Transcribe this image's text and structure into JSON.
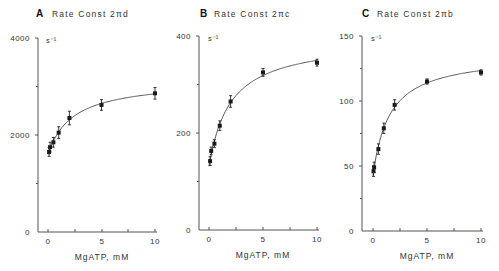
{
  "chart_data": [
    {
      "type": "scatter",
      "panel": "A",
      "title": "Rate Const 2πd",
      "xlabel": "MgATP, mM",
      "ylabel": "s⁻¹",
      "xlim": [
        0,
        10
      ],
      "ylim": [
        0,
        4000
      ],
      "xticks": [
        0,
        5,
        10
      ],
      "yticks": [
        0,
        2000,
        4000
      ],
      "fit_curve": true,
      "grid": false,
      "x": [
        0.1,
        0.2,
        0.5,
        1,
        2,
        5,
        10
      ],
      "y": [
        1650,
        1750,
        1850,
        2050,
        2350,
        2620,
        2860
      ],
      "yerr": [
        90,
        100,
        100,
        120,
        140,
        110,
        120
      ]
    },
    {
      "type": "scatter",
      "panel": "B",
      "title": "Rate Const 2πc",
      "xlabel": "MgATP, mM",
      "ylabel": "s⁻¹",
      "xlim": [
        0,
        10
      ],
      "ylim": [
        0,
        400
      ],
      "xticks": [
        0,
        5,
        10
      ],
      "yticks": [
        0,
        200,
        400
      ],
      "fit_curve": true,
      "grid": false,
      "x": [
        0.1,
        0.2,
        0.5,
        1,
        2,
        5,
        10
      ],
      "y": [
        142,
        163,
        178,
        215,
        265,
        325,
        345
      ],
      "yerr": [
        9,
        8,
        8,
        10,
        12,
        8,
        7
      ]
    },
    {
      "type": "scatter",
      "panel": "C",
      "title": "Rate Const 2πb",
      "xlabel": "MgATP, mM",
      "ylabel": "s⁻¹",
      "xlim": [
        0,
        10
      ],
      "ylim": [
        0,
        150
      ],
      "xticks": [
        0,
        5,
        10
      ],
      "yticks": [
        0,
        50,
        100,
        150
      ],
      "fit_curve": true,
      "grid": false,
      "x": [
        0.05,
        0.1,
        0.5,
        1,
        2,
        5,
        10
      ],
      "y": [
        46,
        49,
        63,
        79,
        97,
        115,
        122
      ],
      "yerr": [
        4,
        4,
        4,
        4,
        4,
        2,
        2
      ]
    }
  ],
  "panels": [
    {
      "letter": "A",
      "title": "Rate Const 2πd",
      "unit": "s⁻¹",
      "xlabel": "MgATP, mM",
      "ytick_labels": [
        "4000",
        "2000",
        "0"
      ],
      "xtick_labels": [
        "0",
        "5",
        "10"
      ]
    },
    {
      "letter": "B",
      "title": "Rate Const 2πc",
      "unit": "s⁻¹",
      "xlabel": "MgATP, mM",
      "ytick_labels": [
        "400",
        "200",
        "0"
      ],
      "xtick_labels": [
        "0",
        "5",
        "10"
      ]
    },
    {
      "letter": "C",
      "title": "Rate Const 2πb",
      "unit": "s⁻¹",
      "xlabel": "MgATP, mM",
      "ytick_labels": [
        "150",
        "100",
        "50",
        "0"
      ],
      "xtick_labels": [
        "0",
        "5",
        "10"
      ]
    }
  ]
}
